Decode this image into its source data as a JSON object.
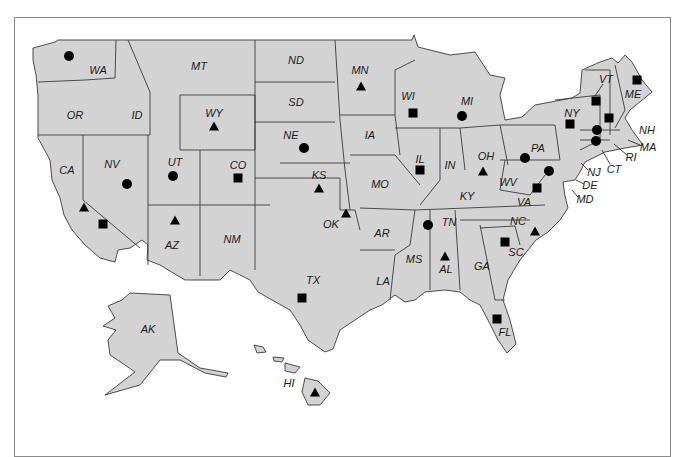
{
  "map": {
    "title": "",
    "colors": {
      "state_fill": "#d3d3d3",
      "border": "#3a3a3a",
      "marker": "#000000",
      "frame": "#8a8a8a"
    },
    "marker_types": [
      "circle",
      "square",
      "triangle"
    ],
    "states": [
      {
        "abbr": "WA",
        "x": 98,
        "y": 70,
        "marker": "circle",
        "mx": 69,
        "my": 56
      },
      {
        "abbr": "OR",
        "x": 75,
        "y": 115,
        "marker": null
      },
      {
        "abbr": "CA",
        "x": 67,
        "y": 170,
        "marker": "triangle",
        "mx": 84,
        "my": 207
      },
      {
        "abbr": "CA-2",
        "label": "",
        "marker": "square",
        "mx": 103,
        "my": 224
      },
      {
        "abbr": "ID",
        "x": 137,
        "y": 115,
        "marker": null
      },
      {
        "abbr": "NV",
        "x": 112,
        "y": 164,
        "marker": "circle",
        "mx": 127,
        "my": 184
      },
      {
        "abbr": "MT",
        "x": 199,
        "y": 66,
        "marker": null
      },
      {
        "abbr": "WY",
        "x": 214,
        "y": 113,
        "marker": "triangle",
        "mx": 214,
        "my": 126
      },
      {
        "abbr": "UT",
        "x": 175,
        "y": 162,
        "marker": "circle",
        "mx": 173,
        "my": 176
      },
      {
        "abbr": "CO",
        "x": 238,
        "y": 165,
        "marker": "square",
        "mx": 238,
        "my": 178
      },
      {
        "abbr": "AZ",
        "x": 172,
        "y": 245,
        "marker": "triangle",
        "mx": 175,
        "my": 220
      },
      {
        "abbr": "NM",
        "x": 232,
        "y": 239,
        "marker": null
      },
      {
        "abbr": "ND",
        "x": 296,
        "y": 60,
        "marker": null
      },
      {
        "abbr": "SD",
        "x": 296,
        "y": 102,
        "marker": null
      },
      {
        "abbr": "NE",
        "x": 291,
        "y": 135,
        "marker": "circle",
        "mx": 304,
        "my": 148
      },
      {
        "abbr": "KS",
        "x": 319,
        "y": 175,
        "marker": "triangle",
        "mx": 319,
        "my": 188
      },
      {
        "abbr": "OK",
        "x": 331,
        "y": 224,
        "marker": "triangle",
        "mx": 346,
        "my": 213
      },
      {
        "abbr": "TX",
        "x": 313,
        "y": 280,
        "marker": "square",
        "mx": 302,
        "my": 298
      },
      {
        "abbr": "MN",
        "x": 360,
        "y": 70,
        "marker": "triangle",
        "mx": 361,
        "my": 86
      },
      {
        "abbr": "IA",
        "x": 370,
        "y": 135,
        "marker": null
      },
      {
        "abbr": "MO",
        "x": 380,
        "y": 184,
        "marker": null
      },
      {
        "abbr": "AR",
        "x": 382,
        "y": 233,
        "marker": null
      },
      {
        "abbr": "LA",
        "x": 383,
        "y": 281,
        "marker": null
      },
      {
        "abbr": "WI",
        "x": 408,
        "y": 96,
        "marker": "square",
        "mx": 413,
        "my": 113
      },
      {
        "abbr": "IL",
        "x": 420,
        "y": 159,
        "marker": "square",
        "mx": 420,
        "my": 170
      },
      {
        "abbr": "MI",
        "x": 467,
        "y": 101,
        "marker": "circle",
        "mx": 462,
        "my": 116
      },
      {
        "abbr": "IN",
        "x": 450,
        "y": 165,
        "marker": null
      },
      {
        "abbr": "OH",
        "x": 486,
        "y": 156,
        "marker": "triangle",
        "mx": 483,
        "my": 171
      },
      {
        "abbr": "KY",
        "x": 467,
        "y": 196,
        "marker": null
      },
      {
        "abbr": "TN",
        "x": 449,
        "y": 222,
        "marker": "circle",
        "mx": 428,
        "my": 225
      },
      {
        "abbr": "MS",
        "x": 414,
        "y": 259,
        "marker": null
      },
      {
        "abbr": "AL",
        "x": 446,
        "y": 269,
        "marker": "triangle",
        "mx": 445,
        "my": 256
      },
      {
        "abbr": "GA",
        "x": 482,
        "y": 266,
        "marker": null
      },
      {
        "abbr": "FL",
        "x": 505,
        "y": 332,
        "marker": "square",
        "mx": 497,
        "my": 319
      },
      {
        "abbr": "SC",
        "x": 516,
        "y": 252,
        "marker": "square",
        "mx": 505,
        "my": 242
      },
      {
        "abbr": "NC",
        "x": 518,
        "y": 221,
        "marker": "triangle",
        "mx": 535,
        "my": 231
      },
      {
        "abbr": "VA",
        "x": 524,
        "y": 202,
        "marker": "square",
        "mx": 537,
        "my": 188
      },
      {
        "abbr": "WV",
        "x": 508,
        "y": 182,
        "marker": null
      },
      {
        "abbr": "PA",
        "x": 538,
        "y": 148,
        "marker": "circle",
        "mx": 525,
        "my": 158
      },
      {
        "abbr": "NY",
        "x": 572,
        "y": 113,
        "marker": "square",
        "mx": 570,
        "my": 124
      },
      {
        "abbr": "VT",
        "x": 606,
        "y": 79,
        "marker": "square",
        "mx": 596,
        "my": 101
      },
      {
        "abbr": "NH",
        "x": 647,
        "y": 130,
        "marker": "square",
        "mx": 609,
        "my": 118
      },
      {
        "abbr": "ME",
        "x": 633,
        "y": 94,
        "marker": "square",
        "mx": 637,
        "my": 80
      },
      {
        "abbr": "MA",
        "x": 648,
        "y": 147,
        "marker": "circle",
        "mx": 597,
        "my": 130
      },
      {
        "abbr": "RI",
        "x": 631,
        "y": 157,
        "marker": null
      },
      {
        "abbr": "CT",
        "x": 614,
        "y": 169,
        "marker": "circle",
        "mx": 596,
        "my": 141
      },
      {
        "abbr": "NJ",
        "x": 594,
        "y": 172,
        "marker": null
      },
      {
        "abbr": "DE",
        "x": 590,
        "y": 185,
        "marker": null
      },
      {
        "abbr": "MD",
        "x": 585,
        "y": 199,
        "marker": "circle",
        "mx": 549,
        "my": 171
      },
      {
        "abbr": "AK",
        "x": 148,
        "y": 329,
        "marker": null
      },
      {
        "abbr": "HI",
        "x": 289,
        "y": 383,
        "marker": "triangle",
        "mx": 315,
        "my": 392
      }
    ]
  }
}
